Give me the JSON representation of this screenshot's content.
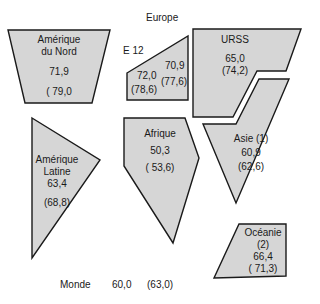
{
  "title": "Europe",
  "regions": [
    {
      "id": "amerique-du-nord",
      "name_line1": "Amérique",
      "name_line2": "du Nord",
      "value": "71,9",
      "projection": "( 79,0"
    },
    {
      "id": "e12",
      "name_line1": "E 12",
      "value": "72,0",
      "projection": "(78,6)"
    },
    {
      "id": "europe-other",
      "value": "70,9",
      "projection": "(77,6)"
    },
    {
      "id": "urss",
      "name_line1": "URSS",
      "value": "65,0",
      "projection": "(74,2)"
    },
    {
      "id": "amerique-latine",
      "name_line1": "Amérique",
      "name_line2": "Latine",
      "value": "63,4",
      "projection": "(68,8)"
    },
    {
      "id": "afrique",
      "name_line1": "Afrique",
      "value": "50,3",
      "projection": "( 53,6)"
    },
    {
      "id": "asie",
      "name_line1": "Asie (1)",
      "value": "60,9",
      "projection": "(62,6)"
    },
    {
      "id": "oceanie",
      "name_line1": "Océanie",
      "name_line2": "(2)",
      "value": "66,4",
      "projection": "( 71,3)"
    }
  ],
  "world": {
    "label": "Monde",
    "value": "60,0",
    "projection": "(63,0)"
  },
  "colors": {
    "fill": "#d6d6d6",
    "stroke": "#1a1a1a"
  }
}
